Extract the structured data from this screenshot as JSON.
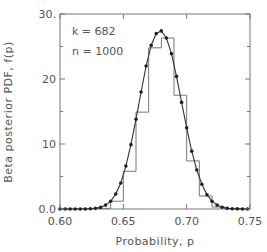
{
  "chart_data": {
    "type": "bar",
    "title": "",
    "xlabel": "Probability, p",
    "ylabel": "Beta posterior PDF, f(p)",
    "xlim": [
      0.6,
      0.75
    ],
    "ylim": [
      0,
      30
    ],
    "grid": false,
    "x_ticks": [
      0.6,
      0.65,
      0.7,
      0.75
    ],
    "x_tick_labels": [
      "0.60",
      "0.65",
      "0.70",
      "0.75"
    ],
    "y_ticks": [
      0,
      10,
      20,
      30
    ],
    "y_tick_labels": [
      "0.0",
      "10",
      "20",
      "30."
    ],
    "annotations": [
      "k = 682",
      "n = 1000"
    ],
    "series": [
      {
        "name": "Histogram",
        "kind": "step",
        "bin_edges": [
          0.63,
          0.64,
          0.65,
          0.66,
          0.67,
          0.68,
          0.69,
          0.7,
          0.71,
          0.72,
          0.73,
          0.74
        ],
        "values": [
          0.1,
          1.2,
          5.8,
          14.9,
          24.8,
          26.3,
          17.5,
          7.4,
          2.0,
          0.3,
          0.05
        ]
      },
      {
        "name": "Beta PDF",
        "kind": "line-with-markers",
        "x": [
          0.6,
          0.604,
          0.608,
          0.612,
          0.616,
          0.62,
          0.624,
          0.628,
          0.632,
          0.636,
          0.64,
          0.644,
          0.648,
          0.652,
          0.656,
          0.66,
          0.664,
          0.668,
          0.672,
          0.676,
          0.68,
          0.684,
          0.688,
          0.692,
          0.696,
          0.7,
          0.704,
          0.708,
          0.712,
          0.716,
          0.72,
          0.724,
          0.728,
          0.732,
          0.736,
          0.74,
          0.744,
          0.748
        ],
        "values": [
          0.0,
          0.0,
          0.0,
          0.0,
          0.0,
          0.01,
          0.03,
          0.1,
          0.25,
          0.6,
          1.2,
          2.3,
          4.0,
          6.6,
          9.9,
          13.8,
          18.0,
          22.0,
          25.2,
          27.0,
          27.4,
          26.3,
          23.9,
          20.4,
          16.4,
          12.5,
          8.9,
          6.0,
          3.8,
          2.2,
          1.2,
          0.6,
          0.28,
          0.12,
          0.05,
          0.02,
          0.01,
          0.0
        ]
      }
    ]
  }
}
